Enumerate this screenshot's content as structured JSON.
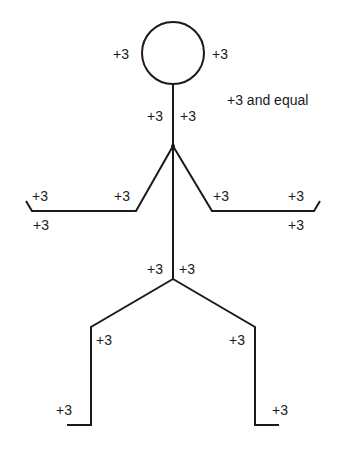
{
  "figure": {
    "type": "stick-figure diagram",
    "stroke_color": "#1a1a1a",
    "background": "#ffffff"
  },
  "labels": {
    "head_left": "+3",
    "head_right": "+3",
    "note": "+3 and equal",
    "neck_left": "+3",
    "neck_right": "+3",
    "left_hand_top": "+3",
    "left_hand_bottom": "+3",
    "left_elbow": "+3",
    "right_elbow": "+3",
    "right_hand_top": "+3",
    "right_hand_bottom": "+3",
    "hip_left": "+3",
    "hip_right": "+3",
    "left_knee": "+3",
    "right_knee": "+3",
    "left_foot": "+3",
    "right_foot": "+3"
  }
}
